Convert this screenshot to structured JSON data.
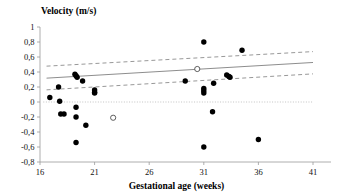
{
  "chart_data": {
    "type": "scatter",
    "title": "",
    "ylabel": "Velocity (m/s)",
    "xlabel": "Gestational age (weeks)",
    "xlim": [
      16,
      41
    ],
    "ylim": [
      -0.8,
      1
    ],
    "xticks": [
      16,
      21,
      26,
      31,
      36,
      41
    ],
    "xtick_labels": [
      "16",
      "21",
      "26",
      "31",
      "36",
      "41"
    ],
    "yticks": [
      -0.8,
      -0.6,
      -0.4,
      -0.2,
      0,
      0.2,
      0.4,
      0.6,
      0.8,
      1
    ],
    "ytick_labels": [
      "-0,8",
      "-0,6",
      "-0,4",
      "-0,2",
      "0",
      "0,2",
      "0,4",
      "0,6",
      "0,8",
      "1"
    ],
    "grid": false,
    "legend": "none",
    "decimal_separator": ",",
    "series": [
      {
        "name": "filled-points",
        "marker": "filled-circle",
        "color": "#000000",
        "points": [
          [
            16.9,
            0.06
          ],
          [
            17.7,
            0.2
          ],
          [
            17.8,
            0.01
          ],
          [
            17.9,
            -0.16
          ],
          [
            18.2,
            -0.16
          ],
          [
            19.2,
            0.37
          ],
          [
            19.3,
            0.35
          ],
          [
            19.4,
            0.33
          ],
          [
            19.3,
            -0.07
          ],
          [
            19.3,
            -0.2
          ],
          [
            19.3,
            -0.54
          ],
          [
            19.9,
            0.28
          ],
          [
            20.2,
            -0.31
          ],
          [
            21.0,
            0.16
          ],
          [
            21.0,
            0.13
          ],
          [
            21.0,
            0.12
          ],
          [
            29.3,
            0.28
          ],
          [
            31.0,
            0.8
          ],
          [
            31.0,
            0.18
          ],
          [
            31.0,
            0.15
          ],
          [
            31.0,
            0.12
          ],
          [
            31.8,
            -0.13
          ],
          [
            31.9,
            0.25
          ],
          [
            33.1,
            0.36
          ],
          [
            33.3,
            0.34
          ],
          [
            33.4,
            0.33
          ],
          [
            34.5,
            0.69
          ],
          [
            31.0,
            -0.6
          ],
          [
            36.0,
            -0.5
          ]
        ]
      },
      {
        "name": "open-points",
        "marker": "open-circle",
        "color": "#ffffff",
        "points": [
          [
            22.7,
            -0.21
          ],
          [
            30.4,
            0.44
          ]
        ]
      }
    ],
    "lines": [
      {
        "name": "regression-line",
        "style": "solid",
        "color": "#808080",
        "x": [
          16.6,
          41.0
        ],
        "y": [
          0.318,
          0.527
        ]
      },
      {
        "name": "upper-confidence-band",
        "style": "dashed",
        "color": "#8c8c8c",
        "x": [
          16.6,
          41.0
        ],
        "y": [
          0.478,
          0.672
        ]
      },
      {
        "name": "lower-confidence-band",
        "style": "dashed",
        "color": "#8c8c8c",
        "x": [
          16.6,
          41.0
        ],
        "y": [
          0.162,
          0.375
        ]
      },
      {
        "name": "zero-reference-line",
        "style": "dotted",
        "color": "#b4b4b4",
        "x": [
          16.3,
          41.0
        ],
        "y": [
          0,
          0
        ]
      }
    ]
  }
}
